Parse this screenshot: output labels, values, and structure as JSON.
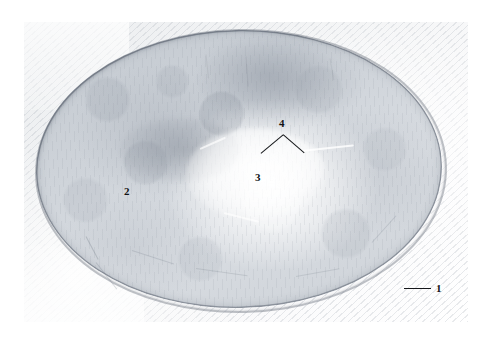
{
  "figure": {
    "kind": "histology-micrograph",
    "width_px": 496,
    "height_px": 348,
    "background_color": "#ffffff",
    "tissue_base_color": "#cfd4da",
    "capsule_color": "#5c6470",
    "pale_zone_color": "#ffffff",
    "annotation_color": "#15171a"
  },
  "annotations": [
    {
      "id": "label-1",
      "text": "1",
      "x": 436,
      "y": 283,
      "leader": {
        "type": "horizontal-line",
        "x": 404,
        "y": 288,
        "length": 27
      },
      "points_to": "capsule"
    },
    {
      "id": "label-2",
      "text": "2",
      "x": 124,
      "y": 186,
      "leader": null,
      "points_to": "cortex"
    },
    {
      "id": "label-3",
      "text": "3",
      "x": 255,
      "y": 172,
      "leader": null,
      "points_to": "medulla"
    },
    {
      "id": "label-4",
      "text": "4",
      "x": 279,
      "y": 118,
      "leader": {
        "type": "v-pointer",
        "apex_x": 283,
        "apex_y": 134,
        "left_x": 261,
        "left_y": 152,
        "right_x": 306,
        "right_y": 153
      },
      "points_to": "trabecula"
    }
  ]
}
